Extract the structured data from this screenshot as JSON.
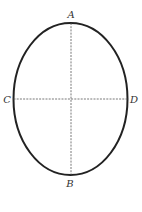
{
  "diagram": {
    "type": "ellipse-with-axes",
    "colors": {
      "outline": "#222222",
      "axis": "#555555",
      "label": "#333333"
    },
    "labels": {
      "top": "A",
      "bottom": "B",
      "left": "C",
      "right": "D"
    }
  }
}
